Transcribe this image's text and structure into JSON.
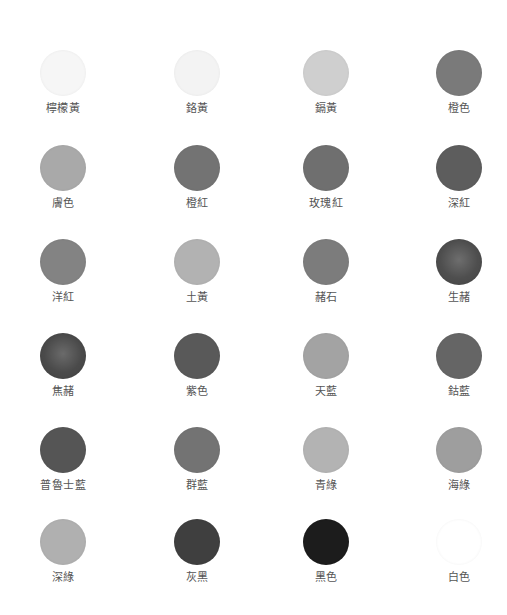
{
  "palette": {
    "columns_x": [
      63,
      197,
      326,
      459
    ],
    "rows_y": [
      50,
      145,
      239,
      333,
      427,
      519
    ],
    "items": [
      {
        "label": "檸檬黃",
        "color": "#f6f6f6",
        "row": 0,
        "col": 0
      },
      {
        "label": "鉻黃",
        "color": "#f3f3f3",
        "row": 0,
        "col": 1
      },
      {
        "label": "鎘黃",
        "color": "#cfcfcf",
        "row": 0,
        "col": 2
      },
      {
        "label": "橙色",
        "color": "#7a7a7a",
        "row": 0,
        "col": 3
      },
      {
        "label": "膚色",
        "color": "#a9a9a9",
        "row": 1,
        "col": 0
      },
      {
        "label": "橙紅",
        "color": "#737373",
        "row": 1,
        "col": 1
      },
      {
        "label": "玫瑰紅",
        "color": "#6f6f6f",
        "row": 1,
        "col": 2
      },
      {
        "label": "深紅",
        "color": "#5d5d5d",
        "row": 1,
        "col": 3
      },
      {
        "label": "洋紅",
        "color": "#838383",
        "row": 2,
        "col": 0
      },
      {
        "label": "土黃",
        "color": "#b2b2b2",
        "row": 2,
        "col": 1
      },
      {
        "label": "赭石",
        "color": "#7c7c7c",
        "row": 2,
        "col": 2
      },
      {
        "label": "生赭",
        "color": "#4e4e4e",
        "row": 2,
        "col": 3,
        "textured": true
      },
      {
        "label": "焦赭",
        "color": "#4a4a4a",
        "row": 3,
        "col": 0,
        "textured": true
      },
      {
        "label": "紫色",
        "color": "#595959",
        "row": 3,
        "col": 1
      },
      {
        "label": "天藍",
        "color": "#a3a3a3",
        "row": 3,
        "col": 2
      },
      {
        "label": "鈷藍",
        "color": "#656565",
        "row": 3,
        "col": 3
      },
      {
        "label": "普魯士藍",
        "color": "#555555",
        "row": 4,
        "col": 0
      },
      {
        "label": "群藍",
        "color": "#737373",
        "row": 4,
        "col": 1
      },
      {
        "label": "青綠",
        "color": "#b3b3b3",
        "row": 4,
        "col": 2
      },
      {
        "label": "海綠",
        "color": "#9e9e9e",
        "row": 4,
        "col": 3
      },
      {
        "label": "深綠",
        "color": "#b0b0b0",
        "row": 5,
        "col": 0
      },
      {
        "label": "灰黑",
        "color": "#3f3f3f",
        "row": 5,
        "col": 1
      },
      {
        "label": "黑色",
        "color": "#1c1c1c",
        "row": 5,
        "col": 2
      },
      {
        "label": "白色",
        "color": "#ffffff",
        "row": 5,
        "col": 3
      }
    ]
  }
}
